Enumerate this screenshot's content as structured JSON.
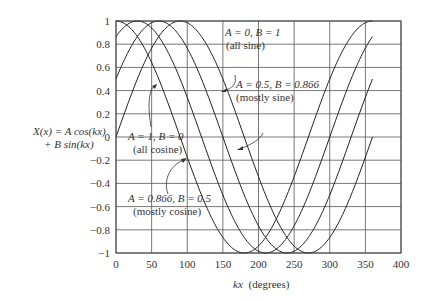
{
  "chart_data": {
    "type": "line",
    "title": "",
    "xlabel": "kx (degrees)",
    "ylabel": "X(x) = A cos(kx) + B sin(kx)",
    "ylabel_lines": [
      "X(x) = A cos(kx)",
      "+ B sin(kx)"
    ],
    "xlim": [
      0,
      400
    ],
    "ylim": [
      -1,
      1
    ],
    "grid": true,
    "x_ticks": [
      0,
      50,
      100,
      150,
      200,
      250,
      300,
      350,
      400
    ],
    "y_ticks": [
      1,
      0.8,
      0.6,
      0.4,
      0.2,
      0,
      -0.2,
      -0.4,
      -0.6,
      -0.8,
      -1
    ],
    "x_tick_labels": [
      "0",
      "50",
      "100",
      "150",
      "200",
      "250",
      "300",
      "350",
      "400"
    ],
    "y_tick_labels": [
      "1",
      "0.8",
      "0.6",
      "0.4",
      "0.2",
      "0",
      "−0.2",
      "−0.4",
      "−0.6",
      "−0.8",
      "−1"
    ],
    "x_range_of_curves": [
      0,
      360
    ],
    "series": [
      {
        "name": "A = 1, B = 0 (all cosine)",
        "A": 1,
        "B": 0,
        "phase_deg": 0,
        "x": [
          0,
          45,
          90,
          135,
          180,
          225,
          270,
          315,
          360
        ],
        "values": [
          1,
          0.707,
          0,
          -0.707,
          -1,
          -0.707,
          0,
          0.707,
          1
        ]
      },
      {
        "name": "A = 0.866, B = 0.5 (mostly cosine)",
        "A": 0.866,
        "B": 0.5,
        "phase_deg": 30,
        "x": [
          0,
          45,
          90,
          135,
          180,
          225,
          270,
          315,
          360
        ],
        "values": [
          0.866,
          0.966,
          0.5,
          -0.259,
          -0.866,
          -0.966,
          -0.5,
          0.259,
          0.866
        ]
      },
      {
        "name": "A = 0.5, B = 0.866 (mostly sine)",
        "A": 0.5,
        "B": 0.866,
        "phase_deg": 60,
        "x": [
          0,
          45,
          90,
          135,
          180,
          225,
          270,
          315,
          360
        ],
        "values": [
          0.5,
          0.966,
          0.866,
          0.259,
          -0.5,
          -0.966,
          -0.866,
          -0.259,
          0.5
        ]
      },
      {
        "name": "A = 0, B = 1 (all sine)",
        "A": 0,
        "B": 1,
        "phase_deg": 90,
        "x": [
          0,
          45,
          90,
          135,
          180,
          225,
          270,
          315,
          360
        ],
        "values": [
          0,
          0.707,
          1,
          0.707,
          0,
          -0.707,
          -1,
          -0.707,
          0
        ]
      }
    ],
    "annotations": [
      {
        "line1": "A = 0, B = 1",
        "line2": "(all sine)"
      },
      {
        "line1": "A = 0.5, B = 0.866",
        "line2": "(mostly sine)"
      },
      {
        "line1": "A = 1, B = 0",
        "line2": "(all cosine)"
      },
      {
        "line1": "A = 0.866, B = 0.5",
        "line2": "(mostly cosine)"
      }
    ]
  },
  "labels": {
    "ylabel_line1": "X(x) = A cos(kx)",
    "ylabel_line2": "+ B sin(kx)",
    "xlabel_kx": "kx",
    "xlabel_unit": "(degrees)",
    "ann_sine_1": "A = 0, B = 1",
    "ann_sine_2": "(all sine)",
    "ann_msine_1": "A = 0.5, B = 0.866",
    "ann_msine_2": "(mostly sine)",
    "ann_cos_1": "A = 1, B = 0",
    "ann_cos_2": "(all cosine)",
    "ann_mcos_1": "A = 0.866, B = 0.5",
    "ann_mcos_2": "(mostly cosine)"
  }
}
